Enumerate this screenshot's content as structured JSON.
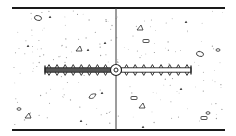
{
  "diagram": {
    "colors": {
      "line": "#1a1a1a",
      "waterstop_shaded": "#555555",
      "speckle": "#9a9a9a",
      "background": "#ffffff"
    },
    "slab": {
      "top_y": 8,
      "bottom_y": 130,
      "left_x": 12,
      "right_x": 225
    },
    "joint": {
      "x": 116
    },
    "waterstop": {
      "center_y": 70,
      "left_x": 45,
      "right_x": 191,
      "bulb": {
        "cx": 116,
        "cy": 70,
        "r_outer": 5.5,
        "r_inner": 2
      },
      "left_half": "shaded",
      "right_half": "outline",
      "ribs_per_side": 8
    },
    "aggregate": {
      "pebbles": [
        {
          "x": 38,
          "y": 18,
          "shape": "oval"
        },
        {
          "x": 79,
          "y": 49,
          "shape": "triangle"
        },
        {
          "x": 93,
          "y": 97,
          "shape": "drop"
        },
        {
          "x": 19,
          "y": 109,
          "shape": "small"
        },
        {
          "x": 28,
          "y": 116,
          "shape": "triangle"
        },
        {
          "x": 140,
          "y": 28,
          "shape": "triangle"
        },
        {
          "x": 146,
          "y": 41,
          "shape": "rect"
        },
        {
          "x": 200,
          "y": 54,
          "shape": "oval"
        },
        {
          "x": 218,
          "y": 50,
          "shape": "small"
        },
        {
          "x": 134,
          "y": 98,
          "shape": "rect"
        },
        {
          "x": 142,
          "y": 106,
          "shape": "triangle"
        },
        {
          "x": 204,
          "y": 118,
          "shape": "rect"
        },
        {
          "x": 208,
          "y": 113,
          "shape": "small"
        }
      ],
      "chips": [
        {
          "x": 50,
          "y": 17
        },
        {
          "x": 28,
          "y": 46
        },
        {
          "x": 88,
          "y": 50
        },
        {
          "x": 105,
          "y": 43
        },
        {
          "x": 102,
          "y": 93
        },
        {
          "x": 81,
          "y": 121
        },
        {
          "x": 186,
          "y": 22
        },
        {
          "x": 181,
          "y": 89
        },
        {
          "x": 143,
          "y": 127
        }
      ]
    }
  }
}
